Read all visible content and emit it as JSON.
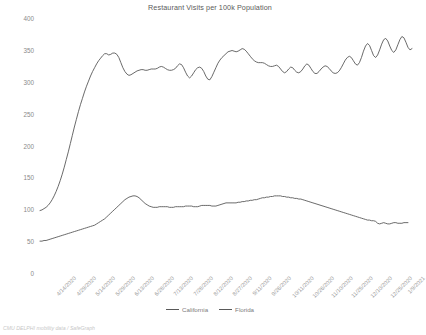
{
  "chart_data": {
    "type": "line",
    "title": "Restaurant Visits per 100k Population",
    "xlabel": "",
    "ylabel": "",
    "ylim": [
      0,
      400
    ],
    "yticks": [
      0,
      50,
      100,
      150,
      200,
      250,
      300,
      350,
      400
    ],
    "grid": false,
    "legend_position": "bottom",
    "source_note": "CMU DELPHI mobility data / SafeGraph",
    "line_color": "#595959",
    "x_tick_labels": [
      "4/14/2020",
      "4/29/2020",
      "5/14/2020",
      "5/29/2020",
      "6/13/2020",
      "6/28/2020",
      "7/13/2020",
      "7/28/2020",
      "8/12/2020",
      "8/27/2020",
      "9/11/2020",
      "9/26/2020",
      "10/11/2020",
      "10/26/2020",
      "11/10/2020",
      "11/25/2020",
      "12/10/2020",
      "12/25/2020",
      "1/9/2021"
    ],
    "x_start": "4/14/2020",
    "x_end": "1/16/2021",
    "series": [
      {
        "name": "California",
        "values": [
          98,
          99,
          101,
          103,
          106,
          110,
          115,
          121,
          128,
          136,
          145,
          155,
          166,
          178,
          190,
          203,
          216,
          229,
          241,
          253,
          264,
          274,
          284,
          293,
          301,
          309,
          316,
          322,
          328,
          333,
          337,
          341,
          344,
          344,
          342,
          343,
          345,
          345,
          343,
          338,
          330,
          322,
          316,
          312,
          310,
          311,
          313,
          315,
          317,
          318,
          319,
          319,
          318,
          318,
          319,
          320,
          320,
          320,
          321,
          323,
          324,
          323,
          321,
          319,
          318,
          318,
          319,
          321,
          325,
          328,
          327,
          322,
          315,
          309,
          306,
          309,
          314,
          319,
          322,
          323,
          321,
          316,
          309,
          304,
          303,
          308,
          315,
          322,
          329,
          334,
          338,
          341,
          344,
          347,
          348,
          349,
          348,
          347,
          348,
          350,
          352,
          351,
          348,
          344,
          340,
          336,
          333,
          331,
          330,
          330,
          330,
          329,
          327,
          325,
          324,
          324,
          325,
          326,
          324,
          320,
          316,
          314,
          316,
          320,
          323,
          322,
          318,
          315,
          314,
          316,
          320,
          325,
          328,
          326,
          321,
          316,
          313,
          313,
          316,
          320,
          323,
          325,
          324,
          321,
          317,
          314,
          313,
          314,
          317,
          322,
          328,
          334,
          338,
          340,
          338,
          333,
          328,
          326,
          330,
          338,
          348,
          356,
          360,
          357,
          349,
          341,
          338,
          342,
          350,
          359,
          366,
          368,
          364,
          356,
          349,
          346,
          350,
          358,
          366,
          371,
          369,
          362,
          354,
          350,
          352
        ]
      },
      {
        "name": "Florida",
        "values": [
          50,
          50,
          51,
          51,
          52,
          53,
          54,
          55,
          56,
          57,
          58,
          59,
          60,
          61,
          62,
          63,
          64,
          65,
          66,
          67,
          68,
          69,
          70,
          71,
          72,
          73,
          74,
          75,
          77,
          79,
          81,
          83,
          85,
          88,
          91,
          94,
          97,
          100,
          103,
          106,
          109,
          112,
          115,
          117,
          119,
          120,
          121,
          121,
          120,
          118,
          115,
          112,
          109,
          107,
          105,
          104,
          103,
          103,
          103,
          104,
          104,
          104,
          104,
          104,
          103,
          103,
          103,
          104,
          104,
          104,
          104,
          104,
          105,
          105,
          105,
          105,
          104,
          104,
          104,
          105,
          106,
          106,
          106,
          106,
          106,
          105,
          105,
          105,
          106,
          107,
          108,
          109,
          110,
          110,
          110,
          110,
          110,
          110,
          111,
          111,
          112,
          112,
          113,
          113,
          114,
          114,
          115,
          115,
          116,
          117,
          118,
          118,
          119,
          119,
          120,
          120,
          121,
          121,
          121,
          121,
          120,
          120,
          119,
          119,
          118,
          118,
          117,
          117,
          116,
          116,
          115,
          114,
          113,
          112,
          111,
          110,
          109,
          108,
          107,
          106,
          105,
          104,
          103,
          102,
          101,
          100,
          99,
          98,
          97,
          96,
          95,
          94,
          93,
          92,
          91,
          90,
          89,
          88,
          87,
          86,
          85,
          84,
          83,
          83,
          82,
          82,
          81,
          78,
          77,
          78,
          79,
          78,
          77,
          77,
          78,
          79,
          79,
          78,
          78,
          78,
          79,
          79,
          79
        ]
      }
    ]
  },
  "legend": {
    "items": [
      {
        "label": "California"
      },
      {
        "label": "Florida"
      }
    ]
  }
}
